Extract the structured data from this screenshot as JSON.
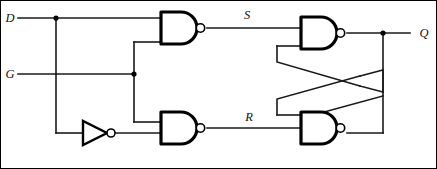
{
  "diagram": {
    "line_color": "#1a1a1a",
    "gate_color": "#000000",
    "background": "#ffffff"
  },
  "labels": {
    "d_input": "D",
    "g_input": "G",
    "s_signal": "S",
    "r_signal": "R",
    "q_output": "Q"
  },
  "gates": [
    {
      "id": "nand-s",
      "type": "NAND",
      "name": "nand-gate-s"
    },
    {
      "id": "nand-r",
      "type": "NAND",
      "name": "nand-gate-r"
    },
    {
      "id": "nand-q",
      "type": "NAND",
      "name": "nand-gate-q"
    },
    {
      "id": "nand-qbar",
      "type": "NAND",
      "name": "nand-gate-qbar"
    },
    {
      "id": "inv-d",
      "type": "NOT",
      "name": "inverter-d"
    }
  ],
  "nets": [
    {
      "from": "D",
      "to": "nand-s input 1"
    },
    {
      "from": "D",
      "to": "inverter-d input"
    },
    {
      "from": "G",
      "to": "nand-s input 2"
    },
    {
      "from": "G",
      "to": "nand-r input 1"
    },
    {
      "from": "inverter-d output",
      "to": "nand-r input 2"
    },
    {
      "from": "nand-s output",
      "to": "S"
    },
    {
      "from": "nand-r output",
      "to": "R"
    },
    {
      "from": "S",
      "to": "nand-q input 1"
    },
    {
      "from": "R",
      "to": "nand-qbar input 2"
    },
    {
      "from": "nand-q output",
      "to": "Q"
    },
    {
      "from": "nand-q output",
      "to": "nand-qbar input 1"
    },
    {
      "from": "nand-qbar output",
      "to": "nand-q input 2"
    }
  ]
}
